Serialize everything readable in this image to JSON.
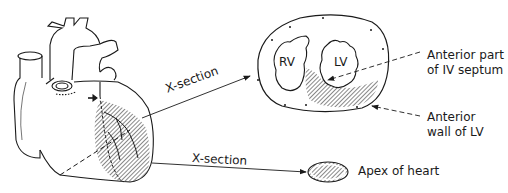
{
  "diagram": {
    "labels": {
      "xsection_upper": "X-section",
      "xsection_lower": "X-section",
      "rv": "RV",
      "lv": "LV",
      "anterior_septum_line1": "Anterior part",
      "anterior_septum_line2": "of IV septum",
      "anterior_wall_line1": "Anterior",
      "anterior_wall_line2": "wall of LV",
      "apex": "Apex of heart"
    },
    "colors": {
      "stroke": "#1a1a1a",
      "hatch": "#555555",
      "background": "#ffffff"
    }
  }
}
